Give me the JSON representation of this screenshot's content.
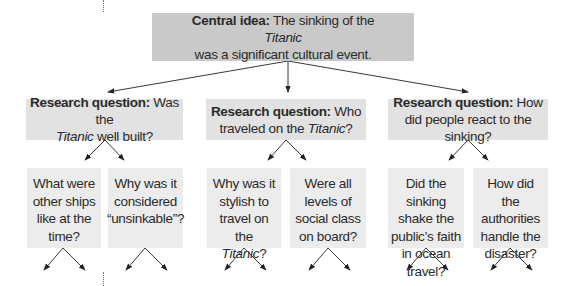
{
  "central": {
    "label": "Central idea:",
    "text_before": "The sinking of the",
    "italic": "Titanic",
    "text_after": "was a significant cultural event."
  },
  "research_questions": [
    {
      "label": "Research question:",
      "text_before": "Was the",
      "italic": "Titanic",
      "text_after": "well built?",
      "sub_questions": [
        {
          "text": "What were other ships like at the time?"
        },
        {
          "text": "Why was it considered “unsinkable”?"
        }
      ]
    },
    {
      "label": "Research question:",
      "text_before": "Who traveled on the",
      "italic": "Titanic",
      "text_after": "?",
      "sub_questions": [
        {
          "text_before": "Why was it stylish to travel on the",
          "italic": "Titanic",
          "text_after": "?"
        },
        {
          "text": "Were all levels of social class on board?"
        }
      ]
    },
    {
      "label": "Research question:",
      "text": "How did people react to the sinking?",
      "sub_questions": [
        {
          "text": "Did the sinking shake the public’s faith in ocean travel?"
        },
        {
          "text": "How did the authorities handle the disaster?"
        }
      ]
    }
  ],
  "colors": {
    "central_bg": "#c9c9c9",
    "research_bg": "#e2e2e2",
    "sub_bg": "#ececec",
    "arrow": "#222222"
  }
}
